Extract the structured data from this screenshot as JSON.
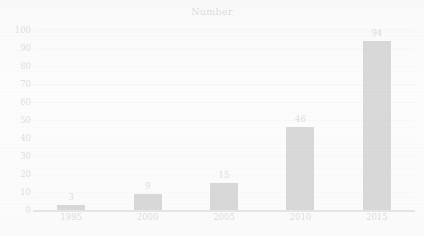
{
  "chart_data": {
    "type": "bar",
    "title": "Number",
    "xlabel": "",
    "ylabel": "",
    "categories": [
      "1995",
      "2000",
      "2005",
      "2010",
      "2015"
    ],
    "values": [
      3,
      9,
      15,
      46,
      94
    ],
    "value_labels": [
      "3",
      "9",
      "15",
      "46",
      "94"
    ],
    "ylim": [
      0,
      100
    ],
    "ytick_labels": [
      "100",
      "90",
      "80",
      "70",
      "60",
      "50",
      "40",
      "30",
      "20",
      "10",
      "0"
    ],
    "ytick_values": [
      100,
      90,
      80,
      70,
      60,
      50,
      40,
      30,
      20,
      10,
      0
    ],
    "grid": true,
    "legend": false,
    "legend_position": "none",
    "bar_color": "#141414",
    "gridline_color": "#e6e6e6",
    "axis_color": "#6f6f6f",
    "background_color": "#fdfdfd"
  }
}
